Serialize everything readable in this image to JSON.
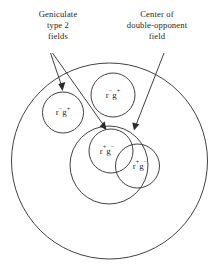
{
  "figure": {
    "background_color": "#ffffff",
    "stroke_color": "#2b2b2b",
    "text_color": "#1f1f1f"
  },
  "annotations": {
    "left": {
      "name": "geniculate-type-2-fields-label",
      "line1": "Geniculate",
      "line2": "type 2",
      "line3": "fields"
    },
    "right": {
      "name": "center-of-double-opponent-field-label",
      "line1": "Center of",
      "line2": "double-opponent",
      "line3": "field"
    }
  },
  "fields": {
    "outer": {
      "label": "",
      "role": "surround-field-boundary"
    },
    "medium": {
      "label": "",
      "role": "double-opponent-field-center"
    },
    "left_small": {
      "r_sign": "−",
      "g_sign": "+",
      "text": "r−g+"
    },
    "top_small": {
      "r_sign": "−",
      "g_sign": "+",
      "text": "r−g+"
    },
    "center_small": {
      "r_sign": "+",
      "g_sign": "−",
      "text": "r+g−"
    },
    "right_small": {
      "r_sign": "+",
      "g_sign": "−",
      "text": "r+g−"
    }
  },
  "glyphs": {
    "r": "r",
    "g": "g",
    "plus": "+",
    "minus": "−"
  }
}
